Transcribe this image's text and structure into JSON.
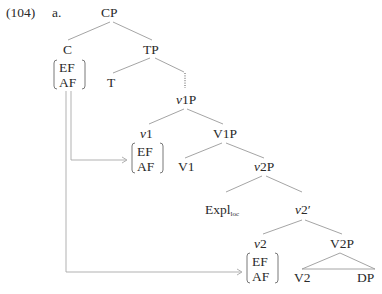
{
  "example": {
    "number": "(104)",
    "letter": "a."
  },
  "tree": {
    "CP": "CP",
    "C": "C",
    "TP": "TP",
    "T": "T",
    "v1P": {
      "italic": "v",
      "rest": "1P"
    },
    "v1": {
      "italic": "v",
      "rest": "1"
    },
    "V1P": "V1P",
    "V1": "V1",
    "v2P": {
      "italic": "v",
      "rest": "2P"
    },
    "Expl": {
      "main": "Expl",
      "sub": "loc"
    },
    "v2bar": {
      "italic": "v",
      "rest": "2′"
    },
    "v2": {
      "italic": "v",
      "rest": "2"
    },
    "V2P": "V2P",
    "V2": "V2",
    "DP": "DP"
  },
  "features": {
    "C": [
      "EF",
      "AF"
    ],
    "v1": [
      "EF",
      "AF"
    ],
    "v2": [
      "EF",
      "AF"
    ]
  }
}
